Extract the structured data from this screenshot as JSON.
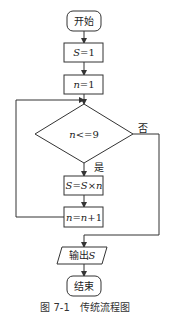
{
  "flowchart": {
    "start": "开始",
    "init_s": {
      "var": "S",
      "rest": "=1"
    },
    "init_n": {
      "var": "n",
      "rest": "=1"
    },
    "condition": {
      "var": "n",
      "rest": "<=9"
    },
    "yes_label": "是",
    "no_label": "否",
    "update_s": {
      "var1": "S",
      "eq": "=",
      "var2": "S",
      "times": "×",
      "var3": "n"
    },
    "update_n": {
      "var1": "n",
      "eq": "=",
      "var2": "n",
      "rest": "+1"
    },
    "output": {
      "text": "输出",
      "var": "S"
    },
    "end": "结束"
  },
  "caption": {
    "number": "图 7-1",
    "title": "传统流程图"
  },
  "colors": {
    "line": "#333333",
    "background": "#ffffff"
  }
}
